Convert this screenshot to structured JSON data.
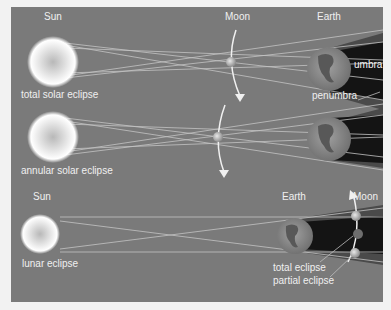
{
  "diagram": {
    "colors": {
      "background": "#7a7a7a",
      "page": "#f2f2f2",
      "umbra": "#141414",
      "penumbra": "#4a4a4a",
      "rays": "#bdbdbd",
      "sun_core": "#e0e0e0",
      "earth_ocean": "#8a8a8a",
      "earth_land": "#5a5a5a"
    },
    "panels": [
      {
        "id": "total-solar",
        "caption": "total solar eclipse",
        "labels": {
          "sun": "Sun",
          "moon": "Moon",
          "earth": "Earth",
          "umbra": "umbra",
          "penumbra": "penumbra"
        }
      },
      {
        "id": "annular-solar",
        "caption": "annular solar eclipse"
      },
      {
        "id": "lunar",
        "caption": "lunar eclipse",
        "labels": {
          "sun": "Sun",
          "earth": "Earth",
          "moon": "Moon",
          "total": "total eclipse",
          "partial": "partial eclipse"
        }
      }
    ]
  }
}
